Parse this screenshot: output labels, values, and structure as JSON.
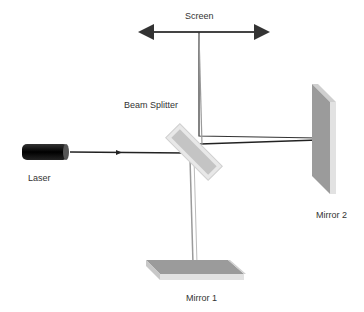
{
  "diagram": {
    "type": "Michelson interferometer",
    "labels": {
      "screen": "Screen",
      "beam_splitter": "Beam Splitter",
      "laser": "Laser",
      "mirror1": "Mirror 1",
      "mirror2": "Mirror 2"
    },
    "colors": {
      "beam_dark": "#222222",
      "beam_light": "#9a9a9a",
      "laser_body": "#111111",
      "mirror_face": "#9b9b9b",
      "mirror_edge": "#e2e2e2",
      "splitter_fill": "#c4c4c4",
      "splitter_edge": "#e8e8e8",
      "text": "#333333"
    }
  }
}
